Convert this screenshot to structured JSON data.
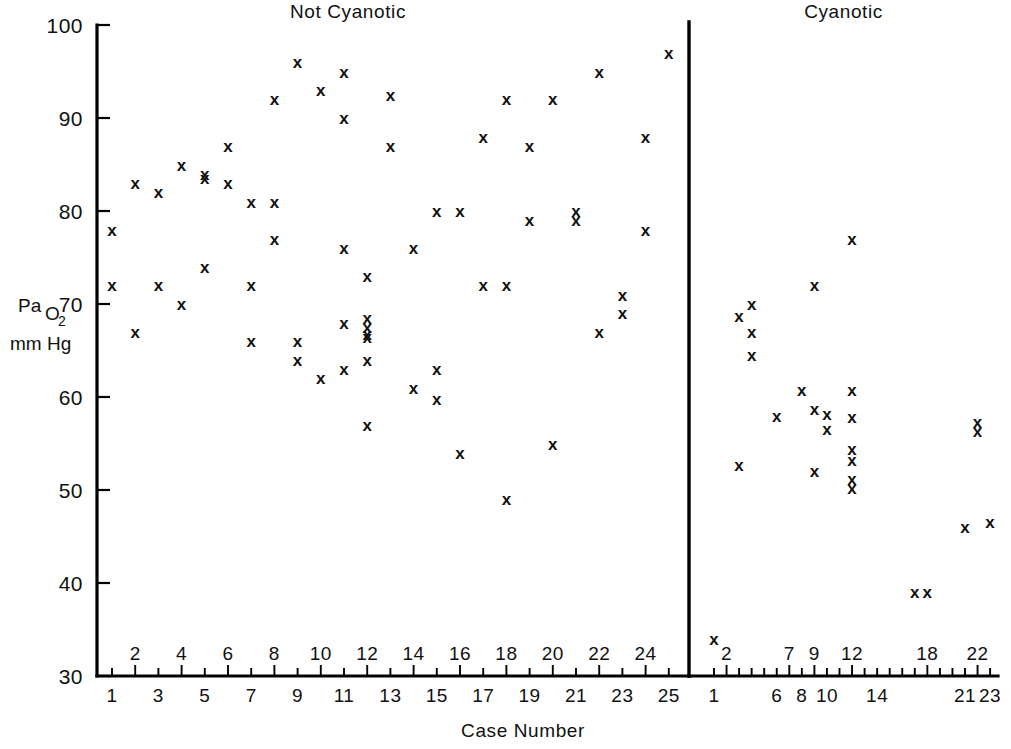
{
  "chart_data": {
    "type": "scatter",
    "title": "",
    "xlabel": "Case Number",
    "ylabel": "PaO2 mm Hg",
    "ylabel_parts": {
      "main": "Pa",
      "sub": "O",
      "sub2": "2",
      "unit": "mm Hg"
    },
    "ylim": [
      30,
      100
    ],
    "ytick_labels": [
      "100",
      "90",
      "80",
      "70",
      "60",
      "50",
      "40",
      "30"
    ],
    "ytick_values": [
      100,
      90,
      80,
      70,
      60,
      50,
      40,
      30
    ],
    "grid": false,
    "legend": "none",
    "marker": "x",
    "panels": [
      {
        "name": "not-cyanotic",
        "title": "Not Cyanotic",
        "xlim": [
          1,
          25
        ],
        "xtick_values": [
          1,
          2,
          3,
          4,
          5,
          6,
          7,
          8,
          9,
          10,
          11,
          12,
          13,
          14,
          15,
          16,
          17,
          18,
          19,
          20,
          21,
          22,
          23,
          24,
          25
        ],
        "xtick_labels_above": [
          "2",
          "4",
          "6",
          "8",
          "10",
          "12",
          "14",
          "16",
          "18",
          "20",
          "22",
          "24"
        ],
        "xtick_values_above": [
          2,
          4,
          6,
          8,
          10,
          12,
          14,
          16,
          18,
          20,
          22,
          24
        ],
        "xtick_labels_below": [
          "1",
          "3",
          "5",
          "7",
          "9",
          "11",
          "13",
          "15",
          "17",
          "19",
          "21",
          "23",
          "25"
        ],
        "xtick_values_below": [
          1,
          3,
          5,
          7,
          9,
          11,
          13,
          15,
          17,
          19,
          21,
          23,
          25
        ],
        "points": [
          {
            "case": 1,
            "pao2": 78
          },
          {
            "case": 1,
            "pao2": 72
          },
          {
            "case": 2,
            "pao2": 83
          },
          {
            "case": 2,
            "pao2": 67
          },
          {
            "case": 3,
            "pao2": 82
          },
          {
            "case": 3,
            "pao2": 72
          },
          {
            "case": 4,
            "pao2": 85
          },
          {
            "case": 4,
            "pao2": 70
          },
          {
            "case": 5,
            "pao2": 84
          },
          {
            "case": 5,
            "pao2": 83.6
          },
          {
            "case": 5,
            "pao2": 74
          },
          {
            "case": 6,
            "pao2": 87
          },
          {
            "case": 6,
            "pao2": 83
          },
          {
            "case": 7,
            "pao2": 81
          },
          {
            "case": 7,
            "pao2": 72
          },
          {
            "case": 7,
            "pao2": 66
          },
          {
            "case": 8,
            "pao2": 92
          },
          {
            "case": 8,
            "pao2": 81
          },
          {
            "case": 8,
            "pao2": 77
          },
          {
            "case": 9,
            "pao2": 96
          },
          {
            "case": 9,
            "pao2": 66
          },
          {
            "case": 9,
            "pao2": 64
          },
          {
            "case": 10,
            "pao2": 93
          },
          {
            "case": 10,
            "pao2": 62
          },
          {
            "case": 11,
            "pao2": 95
          },
          {
            "case": 11,
            "pao2": 90
          },
          {
            "case": 11,
            "pao2": 76
          },
          {
            "case": 11,
            "pao2": 68
          },
          {
            "case": 11,
            "pao2": 63
          },
          {
            "case": 12,
            "pao2": 73
          },
          {
            "case": 12,
            "pao2": 68.5
          },
          {
            "case": 12,
            "pao2": 67.5
          },
          {
            "case": 12,
            "pao2": 66.8
          },
          {
            "case": 12,
            "pao2": 66.4
          },
          {
            "case": 12,
            "pao2": 64
          },
          {
            "case": 12,
            "pao2": 57
          },
          {
            "case": 13,
            "pao2": 92.5
          },
          {
            "case": 13,
            "pao2": 87
          },
          {
            "case": 14,
            "pao2": 76
          },
          {
            "case": 14,
            "pao2": 61
          },
          {
            "case": 15,
            "pao2": 80
          },
          {
            "case": 15,
            "pao2": 63
          },
          {
            "case": 15,
            "pao2": 59.8
          },
          {
            "case": 16,
            "pao2": 80
          },
          {
            "case": 16,
            "pao2": 54
          },
          {
            "case": 17,
            "pao2": 88
          },
          {
            "case": 17,
            "pao2": 72
          },
          {
            "case": 18,
            "pao2": 92
          },
          {
            "case": 18,
            "pao2": 72
          },
          {
            "case": 18,
            "pao2": 49
          },
          {
            "case": 19,
            "pao2": 87
          },
          {
            "case": 19,
            "pao2": 79
          },
          {
            "case": 20,
            "pao2": 92
          },
          {
            "case": 20,
            "pao2": 55
          },
          {
            "case": 21,
            "pao2": 80
          },
          {
            "case": 21,
            "pao2": 79
          },
          {
            "case": 22,
            "pao2": 95
          },
          {
            "case": 22,
            "pao2": 67
          },
          {
            "case": 23,
            "pao2": 71
          },
          {
            "case": 23,
            "pao2": 69
          },
          {
            "case": 24,
            "pao2": 88
          },
          {
            "case": 24,
            "pao2": 78
          },
          {
            "case": 25,
            "pao2": 97
          }
        ]
      },
      {
        "name": "cyanotic",
        "title": "Cyanotic",
        "xlim": [
          1,
          23
        ],
        "xtick_values": [
          1,
          2,
          3,
          4,
          5,
          6,
          7,
          8,
          9,
          10,
          11,
          12,
          13,
          14,
          15,
          16,
          17,
          18,
          19,
          20,
          21,
          22,
          23
        ],
        "xtick_labels_above": [
          "2",
          "7",
          "9",
          "12",
          "18",
          "22"
        ],
        "xtick_values_above": [
          2,
          7,
          9,
          12,
          18,
          22
        ],
        "xtick_labels_below": [
          "1",
          "6",
          "8",
          "10",
          "14",
          "21",
          "23"
        ],
        "xtick_values_below": [
          1,
          6,
          8,
          10,
          14,
          21,
          23
        ],
        "points": [
          {
            "case": 1,
            "pao2": 34
          },
          {
            "case": 3,
            "pao2": 68.7
          },
          {
            "case": 3,
            "pao2": 52.7
          },
          {
            "case": 4,
            "pao2": 70
          },
          {
            "case": 4,
            "pao2": 67
          },
          {
            "case": 4,
            "pao2": 64.5
          },
          {
            "case": 6,
            "pao2": 58
          },
          {
            "case": 8,
            "pao2": 60.7
          },
          {
            "case": 9,
            "pao2": 72
          },
          {
            "case": 9,
            "pao2": 58.7
          },
          {
            "case": 9,
            "pao2": 52
          },
          {
            "case": 10,
            "pao2": 58.2
          },
          {
            "case": 10,
            "pao2": 56.6
          },
          {
            "case": 12,
            "pao2": 77
          },
          {
            "case": 12,
            "pao2": 60.7
          },
          {
            "case": 12,
            "pao2": 57.8
          },
          {
            "case": 12,
            "pao2": 54.4
          },
          {
            "case": 12,
            "pao2": 53.2
          },
          {
            "case": 12,
            "pao2": 51.2
          },
          {
            "case": 12,
            "pao2": 50.2
          },
          {
            "case": 17,
            "pao2": 39
          },
          {
            "case": 18,
            "pao2": 39
          },
          {
            "case": 21,
            "pao2": 46
          },
          {
            "case": 22,
            "pao2": 57.3
          },
          {
            "case": 22,
            "pao2": 56.3
          },
          {
            "case": 23,
            "pao2": 46.6
          }
        ]
      }
    ]
  },
  "geometry": {
    "y_top_px": 25,
    "y_bottom_px": 676,
    "left_axis_x_px": 97,
    "left_case1_x_px": 112,
    "left_case_step_px": 23.2,
    "right_case1_x_px": 714,
    "right_case_step_px": 12.55,
    "divider_x_px": 689,
    "right_axis_end_px": 998
  }
}
